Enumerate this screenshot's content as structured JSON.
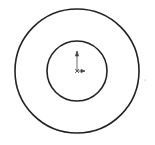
{
  "sketch": {
    "outer_circle": {
      "cx": 77,
      "cy": 71,
      "r": 62,
      "stroke": "#222222"
    },
    "inner_circle": {
      "cx": 77,
      "cy": 71,
      "r": 30,
      "stroke": "#222222"
    },
    "origin": {
      "x": 77,
      "y": 71,
      "color": "#333333"
    }
  }
}
